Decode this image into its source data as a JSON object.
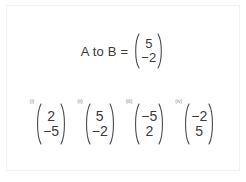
{
  "document": {
    "type": "math-worksheet-question",
    "background_color": "#ffffff",
    "text_color": "#3b3b3b"
  },
  "question": {
    "label": "A to B =",
    "vector": {
      "top": "5",
      "bottom": "−2"
    }
  },
  "options": [
    {
      "label": "(i)",
      "vector": {
        "top": "2",
        "bottom": "−5"
      }
    },
    {
      "label": "(ii)",
      "vector": {
        "top": "5",
        "bottom": "−2"
      }
    },
    {
      "label": "(iii)",
      "vector": {
        "top": "−5",
        "bottom": "2"
      }
    },
    {
      "label": "(iv)",
      "vector": {
        "top": "−2",
        "bottom": "5"
      }
    }
  ]
}
